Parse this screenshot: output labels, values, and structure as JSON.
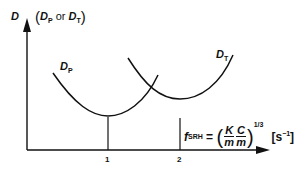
{
  "diagram": {
    "y_axis": {
      "symbol": "D",
      "qualifier_prefix": "(",
      "qualifier_d1": "D",
      "qualifier_s1": "P",
      "qualifier_mid": " or ",
      "qualifier_d2": "D",
      "qualifier_s2": "T",
      "qualifier_suffix": ")"
    },
    "x_axis": {
      "ticks": [
        "1",
        "2"
      ]
    },
    "curves": [
      {
        "name": "D",
        "subscript": "P",
        "min_at_tick": "1"
      },
      {
        "name": "D",
        "subscript": "T",
        "min_at_tick": "2"
      }
    ],
    "formula": {
      "f": "f",
      "f_sub": "SRH",
      "equals": " = ",
      "open": "(",
      "frac1_num": "K",
      "frac1_den": "m",
      "frac2_num": "C",
      "frac2_den": "m",
      "close": ")",
      "exponent": "1/3",
      "unit_base": "[s",
      "unit_exp": "−1",
      "unit_close": "]"
    },
    "colors": {
      "ink": "#111111",
      "background": "#ffffff"
    }
  }
}
